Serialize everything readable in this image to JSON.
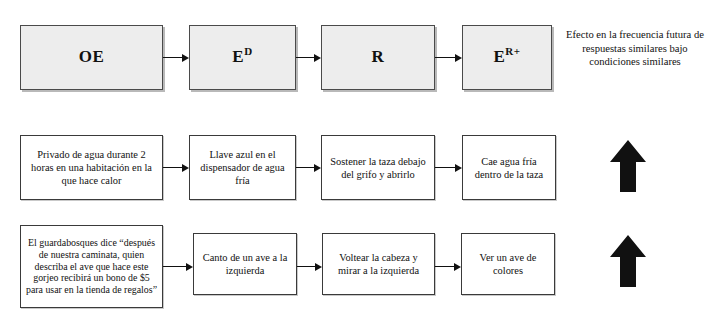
{
  "diagram": {
    "colors": {
      "shaded_box_fill": "#ededed",
      "box_border": "#3a3a3a",
      "arrow": "#111111",
      "background": "#ffffff"
    },
    "rows": [
      {
        "id": "model-row",
        "type": "model",
        "boxes": [
          {
            "name": "oe",
            "label": "OE",
            "sup": ""
          },
          {
            "name": "ed",
            "label": "E",
            "sup": "D"
          },
          {
            "name": "r",
            "label": "R",
            "sup": ""
          },
          {
            "name": "er",
            "label": "E",
            "sup": "R+"
          }
        ],
        "caption": "Efecto en la frecuencia futura de respuestas similares bajo condiciones similares"
      },
      {
        "id": "example-row-water",
        "type": "example",
        "boxes": [
          {
            "name": "water-oe",
            "label": "Privado de agua durante 2 horas en una habitación en la que hace calor"
          },
          {
            "name": "water-ed",
            "label": "Llave azul en el dispensador de agua fría"
          },
          {
            "name": "water-r",
            "label": "Sostener la taza debajo del grifo y abrirlo"
          },
          {
            "name": "water-er",
            "label": "Cae agua fría dentro de la taza"
          }
        ],
        "outcome_icon": "up-arrow-icon"
      },
      {
        "id": "example-row-bird",
        "type": "example",
        "boxes": [
          {
            "name": "bird-oe",
            "label": "El guardabosques dice “después de nuestra caminata, quien describa el ave que hace este gorjeo recibirá un bono de $5 para usar en la tienda de regalos”"
          },
          {
            "name": "bird-ed",
            "label": "Canto de un ave a la izquierda"
          },
          {
            "name": "bird-r",
            "label": "Voltear la cabeza y mirar a la izquierda"
          },
          {
            "name": "bird-er",
            "label": "Ver un ave de colores"
          }
        ],
        "outcome_icon": "up-arrow-icon"
      }
    ]
  }
}
